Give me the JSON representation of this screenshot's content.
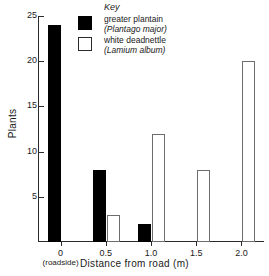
{
  "chart_data": {
    "type": "bar",
    "title": "",
    "xlabel": "Distance from road (m)",
    "ylabel": "Plants",
    "categories": [
      "0",
      "0.5",
      "1.0",
      "1.5",
      "2.0"
    ],
    "category_sublabels": [
      "(roadside)",
      "",
      "",
      "",
      ""
    ],
    "xtick_values": [
      0,
      0.5,
      1.0,
      1.5,
      2.0
    ],
    "ytick_labels": [
      "5",
      "10",
      "15",
      "20",
      "25"
    ],
    "ytick_values": [
      5,
      10,
      15,
      20,
      25
    ],
    "ylim": [
      0,
      25
    ],
    "xlim": [
      -0.25,
      2.25
    ],
    "grid": false,
    "legend_position": "top-center",
    "series": [
      {
        "name": "greater plantain",
        "latin_name": "(Plantago major)",
        "style": "filled",
        "color": "#000000",
        "values": [
          24,
          8,
          2,
          0,
          0
        ]
      },
      {
        "name": "white deadnettle",
        "latin_name": "(Lamium album)",
        "style": "hollow",
        "color": "#ffffff",
        "edge_color": "#6d6d6d",
        "values": [
          0,
          3,
          12,
          8,
          20
        ]
      }
    ]
  },
  "legend": {
    "title": "Key",
    "entries": [
      {
        "common": "greater plantain",
        "latin": "(Plantago major)",
        "style": "filled"
      },
      {
        "common": "white deadnettle",
        "latin": "(Lamium album)",
        "style": "hollow"
      }
    ]
  }
}
